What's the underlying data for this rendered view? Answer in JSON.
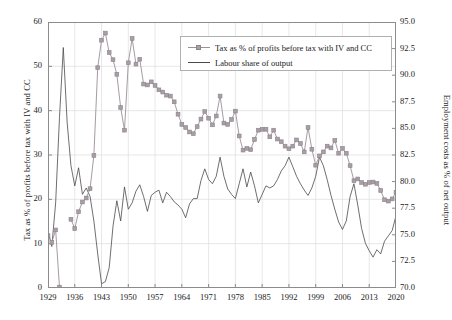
{
  "chart_data": {
    "type": "line",
    "title": "",
    "xlabel": "",
    "ylabel": "Tax as % of profits before tax with IV and CC",
    "y2label": "Employment costs as % of net output",
    "grid": true,
    "legend_position": "top-right",
    "xlim": [
      1929,
      2020
    ],
    "ylim": [
      0,
      60
    ],
    "y2lim": [
      70.0,
      95.0
    ],
    "xticks": [
      "1929",
      "1936",
      "1943",
      "1950",
      "1957",
      "1964",
      "1971",
      "1978",
      "1985",
      "1992",
      "1999",
      "2006",
      "2013",
      "2020"
    ],
    "yticks": [
      "0",
      "10",
      "20",
      "30",
      "40",
      "50",
      "60"
    ],
    "y2ticks": [
      "70.0",
      "72.5",
      "75.0",
      "77.5",
      "80.0",
      "82.5",
      "85.0",
      "87.5",
      "90.0",
      "92.5",
      "95.0"
    ],
    "x": [
      1929,
      1930,
      1931,
      1932,
      1933,
      1934,
      1935,
      1936,
      1937,
      1938,
      1939,
      1940,
      1941,
      1942,
      1943,
      1944,
      1945,
      1946,
      1947,
      1948,
      1949,
      1950,
      1951,
      1952,
      1953,
      1954,
      1955,
      1956,
      1957,
      1958,
      1959,
      1960,
      1961,
      1962,
      1963,
      1964,
      1965,
      1966,
      1967,
      1968,
      1969,
      1970,
      1971,
      1972,
      1973,
      1974,
      1975,
      1976,
      1977,
      1978,
      1979,
      1980,
      1981,
      1982,
      1983,
      1984,
      1985,
      1986,
      1987,
      1988,
      1989,
      1990,
      1991,
      1992,
      1993,
      1994,
      1995,
      1996,
      1997,
      1998,
      1999,
      2000,
      2001,
      2002,
      2003,
      2004,
      2005,
      2006,
      2007,
      2008,
      2009,
      2010,
      2011,
      2012,
      2013,
      2014,
      2015,
      2016,
      2017,
      2018,
      2019,
      2020
    ],
    "series": [
      {
        "name": "Tax as % of profits before tax with IV and CC",
        "axis": "left",
        "color": "#9a9098",
        "marker": "square",
        "values": [
          11.8,
          10.3,
          13.1,
          0.2,
          null,
          null,
          15.5,
          13.4,
          17.2,
          19.4,
          20.3,
          22.4,
          29.9,
          49.7,
          55.9,
          57.5,
          53.1,
          51.5,
          48.2,
          40.7,
          35.6,
          50.8,
          56.3,
          50.5,
          51.6,
          46.0,
          45.8,
          46.5,
          45.7,
          44.7,
          44.2,
          43.5,
          43.3,
          42.0,
          39.2,
          36.9,
          36.2,
          35.2,
          34.8,
          36.4,
          38.1,
          39.8,
          38.3,
          36.8,
          38.8,
          43.3,
          37.2,
          36.9,
          38.0,
          39.9,
          34.3,
          31.1,
          31.5,
          31.2,
          33.5,
          35.6,
          35.8,
          35.8,
          34.1,
          35.6,
          33.6,
          33.0,
          32.0,
          31.4,
          32.0,
          33.4,
          32.6,
          30.7,
          36.2,
          31.3,
          27.7,
          29.8,
          30.7,
          32.0,
          31.6,
          33.3,
          30.4,
          31.5,
          30.4,
          27.6,
          24.2,
          24.6,
          23.8,
          23.4,
          23.8,
          23.9,
          23.6,
          22.0,
          19.9,
          19.6,
          20.1,
          21.6
        ]
      },
      {
        "name": "Labour share of output",
        "axis": "right",
        "color": "#4a4a4a",
        "marker": "none",
        "values": [
          75.4,
          73.9,
          78.0,
          86.0,
          92.6,
          85.6,
          81.5,
          79.6,
          81.3,
          78.8,
          79.4,
          78.6,
          76.3,
          73.2,
          70.4,
          70.6,
          71.9,
          75.8,
          78.2,
          76.3,
          79.5,
          77.4,
          78.0,
          79.1,
          79.7,
          78.6,
          77.2,
          78.7,
          79.0,
          79.2,
          78.0,
          79.0,
          78.6,
          78.1,
          77.8,
          77.4,
          76.6,
          77.9,
          78.4,
          78.4,
          80.1,
          81.2,
          80.2,
          79.8,
          80.5,
          82.3,
          80.5,
          79.3,
          78.8,
          78.4,
          79.8,
          81.2,
          79.5,
          80.9,
          79.6,
          78.0,
          78.8,
          79.6,
          79.4,
          79.6,
          80.2,
          81.0,
          81.5,
          82.3,
          81.4,
          80.5,
          79.8,
          79.2,
          78.7,
          79.4,
          80.5,
          82.3,
          81.5,
          80.2,
          78.7,
          77.4,
          76.2,
          75.5,
          76.3,
          78.6,
          79.8,
          77.8,
          75.6,
          74.2,
          73.5,
          72.9,
          73.6,
          73.2,
          74.4,
          74.9,
          75.4,
          76.8
        ]
      }
    ]
  },
  "axes": {
    "left_title": "Tax as % of profits before tax with IV and CC",
    "right_title": "Employment costs as % of net output"
  },
  "legend": {
    "entries": [
      {
        "label": "Tax as % of profits before tax with IV and CC"
      },
      {
        "label": "Labour share of output"
      }
    ]
  }
}
